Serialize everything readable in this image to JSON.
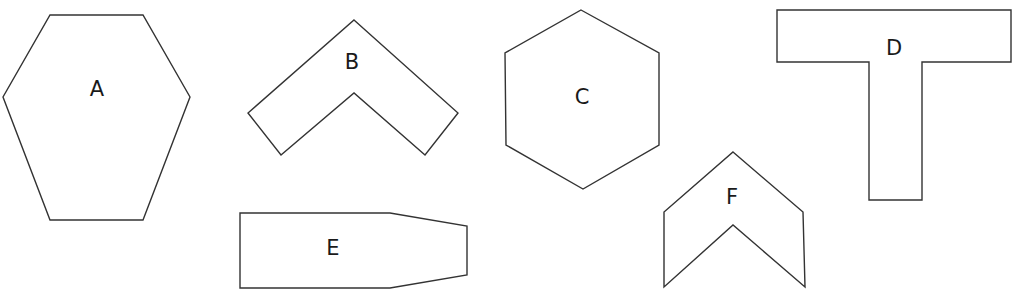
{
  "diagram": {
    "stroke_color": "#333333",
    "label_color": "#1a1a1a",
    "shapes": [
      {
        "id": "A",
        "label": "A",
        "type": "hexagon-elongated",
        "points": "50,15 143,15 190,97 143,220 50,220 3,97",
        "label_pos": [
          97,
          89
        ]
      },
      {
        "id": "B",
        "label": "B",
        "type": "chevron",
        "points": "354,20 458,113 425,155 354,93 281,155 248,113",
        "label_pos": [
          352,
          62
        ]
      },
      {
        "id": "C",
        "label": "C",
        "type": "regular-hexagon",
        "points": "581,10 659,53 659,145 583,189 506,145 505,53",
        "label_pos": [
          582,
          97
        ]
      },
      {
        "id": "D",
        "label": "D",
        "type": "t-shape",
        "points": "777,10 1011,10 1011,62 922,62 922,200 869,200 869,62 777,62",
        "label_pos": [
          894,
          48
        ]
      },
      {
        "id": "E",
        "label": "E",
        "type": "tapered-rectangle",
        "points": "240,213 390,213 467,226 467,275 390,288 240,288",
        "label_pos": [
          333,
          248
        ]
      },
      {
        "id": "F",
        "label": "F",
        "type": "arrowhead-chevron",
        "points": "733,152 803,212 805,287 733,225 664,287 664,212",
        "label_pos": [
          732,
          197
        ]
      }
    ]
  }
}
